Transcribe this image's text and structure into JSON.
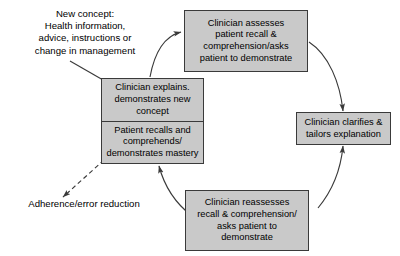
{
  "diagram": {
    "background_color": "#ffffff",
    "node_fill_color": "#c9c9c9",
    "node_border_color": "#3a3a3a",
    "arrow_color": "#3a3a3a",
    "text_color": "#000000",
    "annotations": [
      {
        "name": "new-concept-annotation",
        "lines": [
          "New concept:",
          "Health information,",
          "advice, instructions or",
          "change in management"
        ]
      },
      {
        "name": "outcome-annotation",
        "lines": [
          "Adherence/error reduction"
        ]
      }
    ],
    "nodes": [
      {
        "name": "clinician-explains-node",
        "sections": [
          {
            "name": "clinician-explains-section",
            "lines": [
              "Clinician explains.",
              "demonstrates new",
              "concept"
            ]
          },
          {
            "name": "patient-recalls-section",
            "lines": [
              "Patient recalls and",
              "comprehends/",
              "demonstrates mastery"
            ]
          }
        ]
      },
      {
        "name": "clinician-assesses-node",
        "lines": [
          "Clinician assesses",
          "patient recall &",
          "comprehension/asks",
          "patient to demonstrate"
        ]
      },
      {
        "name": "clinician-clarifies-node",
        "lines": [
          "Clinician clarifies &",
          "tailors explanation"
        ]
      },
      {
        "name": "clinician-reassesses-node",
        "lines": [
          "Clinician reassesses",
          "recall & comprehension/",
          "asks patient to",
          "demonstrate"
        ]
      }
    ],
    "connectors": [
      {
        "name": "arrow-new-concept-to-explains",
        "style": "solid"
      },
      {
        "name": "arrow-explains-to-assesses",
        "style": "solid"
      },
      {
        "name": "arrow-assesses-to-clarifies",
        "style": "solid"
      },
      {
        "name": "arrow-reassesses-to-clarifies",
        "style": "solid"
      },
      {
        "name": "arrow-reassesses-to-explains",
        "style": "solid"
      },
      {
        "name": "arrow-explains-to-adherence",
        "style": "dashed"
      }
    ]
  }
}
